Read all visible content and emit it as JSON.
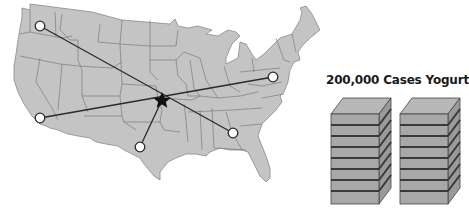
{
  "diagram": {
    "title": "200,000 Cases Yogurt",
    "type": "distribution-network-map",
    "map_region": "Continental United States",
    "colors": {
      "map_fill": "#c4c4c4",
      "state_border": "#6e6e6e",
      "route_line": "#2a2a2a",
      "hub_star": "#111111",
      "node_fill": "#ffffff",
      "box_front": "#a8a8a8",
      "box_top": "#b8b8b8",
      "box_side": "#9a9a9a",
      "box_stripe": "#3a3a3a"
    },
    "hub": {
      "name": "central-hub-star",
      "x": 162,
      "y": 100
    },
    "nodes": [
      {
        "name": "northwest-node",
        "x": 40,
        "y": 26
      },
      {
        "name": "california-node",
        "x": 40,
        "y": 118
      },
      {
        "name": "texas-node",
        "x": 140,
        "y": 147
      },
      {
        "name": "southeast-node",
        "x": 233,
        "y": 133
      },
      {
        "name": "northeast-node",
        "x": 273,
        "y": 77
      }
    ],
    "routes": [
      {
        "from": "northwest-node",
        "to": "southeast-node"
      },
      {
        "from": "california-node",
        "to": "northeast-node"
      },
      {
        "from": "central-hub-star",
        "to": "texas-node"
      }
    ],
    "stacks": [
      {
        "name": "yogurt-stack-left",
        "layers": 8
      },
      {
        "name": "yogurt-stack-right",
        "layers": 8
      }
    ]
  }
}
